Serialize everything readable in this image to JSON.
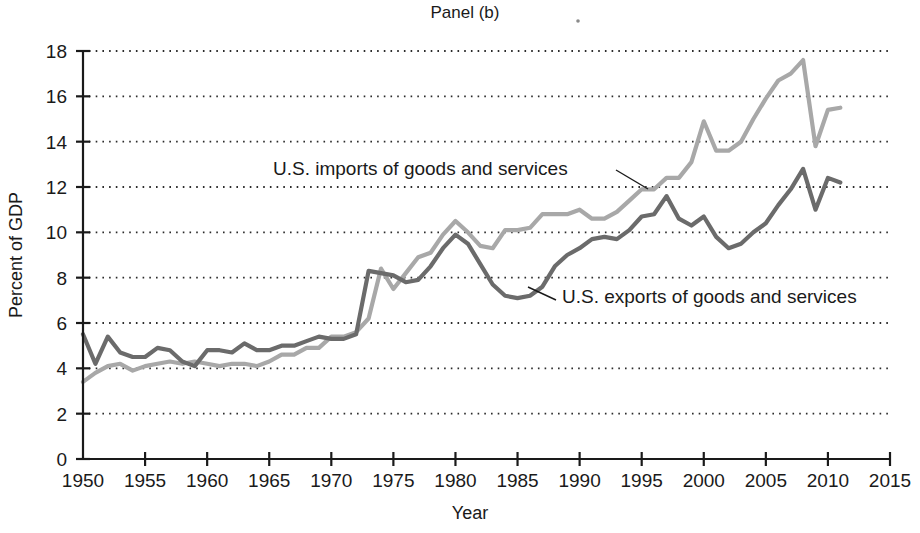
{
  "figure": {
    "panel_title": "Panel (b)",
    "speck_artifact": true
  },
  "chart_data": {
    "type": "line",
    "title": "Panel (b)",
    "xlabel": "Year",
    "ylabel": "Percent of GDP",
    "xlim": [
      1950,
      2015
    ],
    "ylim": [
      0,
      18
    ],
    "xticks": [
      1950,
      1955,
      1960,
      1965,
      1970,
      1975,
      1980,
      1985,
      1990,
      1995,
      2000,
      2005,
      2010,
      2015
    ],
    "yticks": [
      0,
      2,
      4,
      6,
      8,
      10,
      12,
      14,
      16,
      18
    ],
    "xtick_labels": [
      "1950",
      "1955",
      "1960",
      "1965",
      "1970",
      "1975",
      "1980",
      "1985",
      "1990",
      "1995",
      "2000",
      "2005",
      "2010",
      "2015"
    ],
    "ytick_labels": [
      "0",
      "2",
      "4",
      "6",
      "8",
      "10",
      "12",
      "14",
      "16",
      "18"
    ],
    "grid": "horizontal-dotted",
    "legend": "inline-annotations",
    "annotations": [
      {
        "text": "U.S. imports of goods and services",
        "series": "imports",
        "text_x": 273,
        "text_y": 175,
        "leader": [
          [
            616,
            170
          ],
          [
            648,
            189
          ]
        ]
      },
      {
        "text": "U.S. exports of goods and services",
        "series": "exports",
        "text_x": 562,
        "text_y": 303,
        "leader": [
          [
            556,
            300
          ],
          [
            528,
            287
          ]
        ]
      }
    ],
    "series": [
      {
        "name": "U.S. imports of goods and services",
        "color": "#a8a8a8",
        "x": [
          1950,
          1951,
          1952,
          1953,
          1954,
          1955,
          1956,
          1957,
          1958,
          1959,
          1960,
          1961,
          1962,
          1963,
          1964,
          1965,
          1966,
          1967,
          1968,
          1969,
          1970,
          1971,
          1972,
          1973,
          1974,
          1975,
          1976,
          1977,
          1978,
          1979,
          1980,
          1981,
          1982,
          1983,
          1984,
          1985,
          1986,
          1987,
          1988,
          1989,
          1990,
          1991,
          1992,
          1993,
          1994,
          1995,
          1996,
          1997,
          1998,
          1999,
          2000,
          2001,
          2002,
          2003,
          2004,
          2005,
          2006,
          2007,
          2008,
          2009,
          2010,
          2011
        ],
        "values": [
          3.4,
          3.8,
          4.1,
          4.2,
          3.9,
          4.1,
          4.2,
          4.3,
          4.2,
          4.3,
          4.2,
          4.1,
          4.2,
          4.2,
          4.1,
          4.3,
          4.6,
          4.6,
          4.9,
          4.9,
          5.4,
          5.4,
          5.6,
          6.2,
          8.4,
          7.5,
          8.2,
          8.9,
          9.1,
          9.9,
          10.5,
          10.0,
          9.4,
          9.3,
          10.1,
          10.1,
          10.2,
          10.8,
          10.8,
          10.8,
          11.0,
          10.6,
          10.6,
          10.9,
          11.4,
          11.9,
          11.9,
          12.4,
          12.4,
          13.1,
          14.9,
          13.6,
          13.6,
          14.0,
          15.0,
          15.9,
          16.7,
          17.0,
          17.6,
          13.8,
          15.4,
          15.5
        ]
      },
      {
        "name": "U.S. exports of goods and services",
        "color": "#6b6b6b",
        "x": [
          1950,
          1951,
          1952,
          1953,
          1954,
          1955,
          1956,
          1957,
          1958,
          1959,
          1960,
          1961,
          1962,
          1963,
          1964,
          1965,
          1966,
          1967,
          1968,
          1969,
          1970,
          1971,
          1972,
          1973,
          1974,
          1975,
          1976,
          1977,
          1978,
          1979,
          1980,
          1981,
          1982,
          1983,
          1984,
          1985,
          1986,
          1987,
          1988,
          1989,
          1990,
          1991,
          1992,
          1993,
          1994,
          1995,
          1996,
          1997,
          1998,
          1999,
          2000,
          2001,
          2002,
          2003,
          2004,
          2005,
          2006,
          2007,
          2008,
          2009,
          2010,
          2011
        ],
        "values": [
          5.5,
          4.2,
          5.4,
          4.7,
          4.5,
          4.5,
          4.9,
          4.8,
          4.3,
          4.1,
          4.8,
          4.8,
          4.7,
          5.1,
          4.8,
          4.8,
          5.0,
          5.0,
          5.2,
          5.4,
          5.3,
          5.3,
          5.5,
          8.3,
          8.2,
          8.1,
          7.8,
          7.9,
          8.5,
          9.3,
          9.9,
          9.5,
          8.6,
          7.7,
          7.2,
          7.1,
          7.2,
          7.6,
          8.5,
          9.0,
          9.3,
          9.7,
          9.8,
          9.7,
          10.1,
          10.7,
          10.8,
          11.6,
          10.6,
          10.3,
          10.7,
          9.8,
          9.3,
          9.5,
          10.0,
          10.4,
          11.2,
          11.9,
          12.8,
          11.0,
          12.4,
          12.2
        ]
      }
    ]
  },
  "axes_geometry": {
    "x0": 83,
    "x1": 890,
    "y0": 459,
    "ytop": 51,
    "x_min": 1950,
    "x_max": 2015,
    "y_min": 0,
    "y_max": 18
  },
  "labels": {
    "y_axis_title": "Percent of GDP",
    "x_axis_title": "Year"
  }
}
